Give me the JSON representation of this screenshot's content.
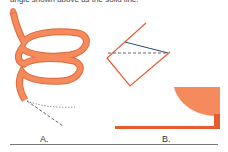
{
  "caption": "angle shown above as the solid line.",
  "figures": [
    {
      "id": "A",
      "label": "A.",
      "description": "orange coiled tube with dashed and dotted lines"
    },
    {
      "id": "B",
      "label": "B.",
      "description": "tilted square with solid and dashed diagonals; quarter-circle on a base line"
    }
  ],
  "colors": {
    "coil_fill": "#f58a5c",
    "coil_outline": "#e06a3c",
    "red_line": "#ea5a30",
    "blue_line": "#2d4b78",
    "dashed": "#555555",
    "dotted": "#777777",
    "quarter_fill": "#f58a5c"
  }
}
